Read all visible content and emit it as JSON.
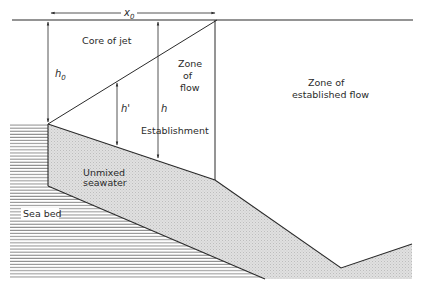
{
  "diagram": {
    "title": "",
    "page_number": "",
    "labels": {
      "core_of_jet": "Core of jet",
      "zone_of_flow_line1": "Zone",
      "zone_of_flow_line2": "of",
      "zone_of_flow_line3": "flow",
      "establishment": "Establishment",
      "zone_established_line1": "Zone of",
      "zone_established_line2": "established flow",
      "unmixed_line1": "Unmixed",
      "unmixed_line2": "seawater",
      "sea_bed": "Sea bed"
    },
    "dimensions": {
      "x0": {
        "symbol": "x",
        "subscript": "0"
      },
      "h0": {
        "symbol": "h",
        "subscript": "0"
      },
      "h_prime": {
        "symbol": "h'"
      },
      "h": {
        "symbol": "h"
      }
    },
    "colors": {
      "line": "#2a2a2a",
      "shade": "#d9d9d9",
      "hatch": "#7a7a7a",
      "background": "#ffffff"
    }
  }
}
